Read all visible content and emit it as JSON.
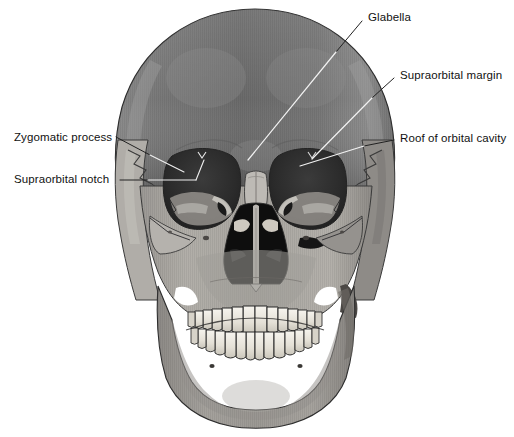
{
  "figure": {
    "view": "frontal",
    "background_color": "#ffffff",
    "bone_palette": {
      "cranium_dark": "#6e6e6e",
      "cranium_mid": "#7d7d7d",
      "bone_light": "#a9a6a2",
      "bone_pale": "#c2bfba",
      "bone_shadow": "#5a5a5a",
      "orbit_cavity": "#2a2a2a",
      "nasal_cavity": "#111111",
      "tooth_enamel": "#efece4",
      "outline": "#1b1b1b",
      "leader_on_bone": "#f2f2f2",
      "leader_on_background": "#222222"
    }
  },
  "labels": [
    {
      "id": "zygomatic-process",
      "text": "Zygomatic process",
      "side": "left",
      "text_x": 14,
      "text_y": 131,
      "leader_from_x": 116,
      "leader_from_y": 137,
      "leader_to_x": 184,
      "leader_to_y": 172
    },
    {
      "id": "supraorbital-notch",
      "text": "Supraorbital notch",
      "side": "left",
      "text_x": 14,
      "text_y": 173,
      "leader_from_x": 120,
      "leader_from_y": 180,
      "leader_to_x": 196,
      "leader_to_y": 180
    },
    {
      "id": "glabella",
      "text": "Glabella",
      "side": "right",
      "text_x": 368,
      "text_y": 11,
      "leader_from_x": 362,
      "leader_from_y": 21,
      "leader_to_x": 248,
      "leader_to_y": 160
    },
    {
      "id": "supraorbital-margin",
      "text": "Supraorbital margin",
      "side": "right",
      "text_x": 400,
      "text_y": 69,
      "leader_from_x": 394,
      "leader_from_y": 78,
      "leader_to_x": 312,
      "leader_to_y": 159
    },
    {
      "id": "roof-of-orbital-cavity",
      "text": "Roof of orbital cavity",
      "side": "right",
      "text_x": 400,
      "text_y": 132,
      "leader_from_x": 394,
      "leader_from_y": 140,
      "leader_to_x": 300,
      "leader_to_y": 166
    }
  ]
}
